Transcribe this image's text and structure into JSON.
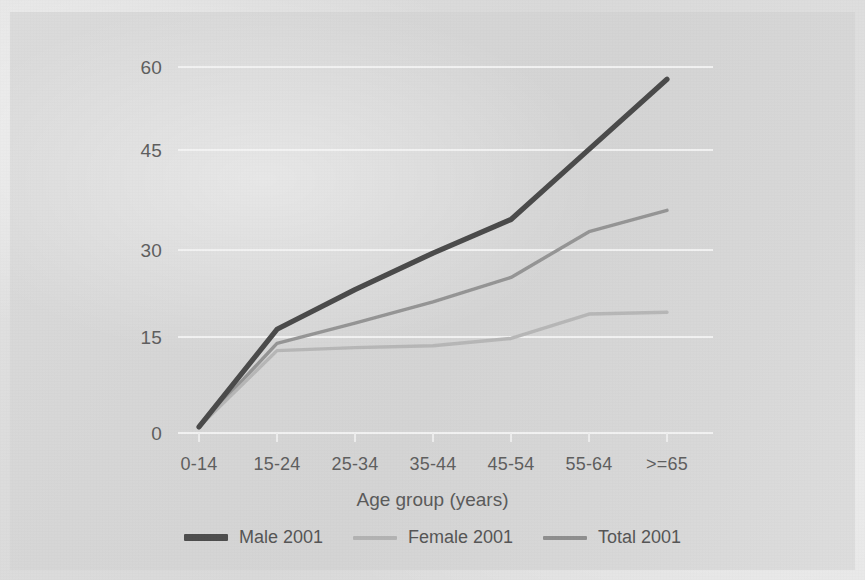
{
  "chart_data": {
    "type": "line",
    "title": "",
    "xlabel": "Age group (years)",
    "ylabel": "",
    "categories": [
      "0-14",
      "15-24",
      "25-34",
      "35-44",
      "45-54",
      "55-64",
      ">=65"
    ],
    "yticks": [
      0,
      15,
      30,
      45,
      60
    ],
    "ylim": [
      0,
      63
    ],
    "grid": "horizontal",
    "legend_position": "bottom",
    "series": [
      {
        "name": "Male 2001",
        "color": "#4a4a4a",
        "width": 5,
        "values": [
          1.0,
          17.0,
          23.5,
          29.5,
          35.0,
          46.5,
          58.0
        ]
      },
      {
        "name": "Female 2001",
        "color": "#b4b4b4",
        "width": 3,
        "values": [
          1.0,
          13.5,
          14.0,
          14.3,
          15.5,
          19.5,
          19.8
        ]
      },
      {
        "name": "Total 2001",
        "color": "#8e8e8e",
        "width": 3,
        "values": [
          1.0,
          14.7,
          18.0,
          21.5,
          25.5,
          33.0,
          36.5
        ]
      }
    ]
  },
  "axis": {
    "x_title": "Age group (years)"
  },
  "legend": {
    "items": [
      {
        "label": "Male 2001"
      },
      {
        "label": "Female 2001"
      },
      {
        "label": "Total 2001"
      }
    ]
  },
  "colors": {
    "background": "#d6d6d6",
    "gridline": "#f2f2f2",
    "tick_text": "#5e5e5e",
    "male": "#4a4a4a",
    "female": "#b4b4b4",
    "total": "#8e8e8e"
  }
}
